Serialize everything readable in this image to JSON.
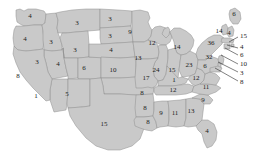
{
  "map": {
    "title": "United States electoral vote map",
    "colors": {
      "land_fill": "#c9c9c9",
      "land_fill_light": "#efefef",
      "border": "#8e8e8e",
      "outline": "#6f6f6f",
      "background": "#ffffff",
      "label_text": "#1b1b1b",
      "leader_line": "#2b2b2b"
    },
    "states": [
      {
        "name": "washington",
        "abbr": "WA",
        "value": "4",
        "x": 30,
        "y": 16
      },
      {
        "name": "oregon",
        "abbr": "OR",
        "value": "4",
        "x": 25,
        "y": 39
      },
      {
        "name": "idaho",
        "abbr": "ID",
        "value": "3",
        "x": 51,
        "y": 42
      },
      {
        "name": "montana",
        "abbr": "MT",
        "value": "3",
        "x": 77,
        "y": 23
      },
      {
        "name": "nevada",
        "abbr": "NV",
        "value": "3",
        "x": 37,
        "y": 62
      },
      {
        "name": "wyoming",
        "abbr": "WY",
        "value": "3",
        "x": 75,
        "y": 50
      },
      {
        "name": "north-dakota",
        "abbr": "ND",
        "value": "3",
        "x": 110,
        "y": 19
      },
      {
        "name": "south-dakota",
        "abbr": "SD",
        "value": "3",
        "x": 110,
        "y": 36
      },
      {
        "name": "nebraska",
        "abbr": "NE",
        "value": "4",
        "x": 111,
        "y": 50
      },
      {
        "name": "utah",
        "abbr": "UT",
        "value": "4",
        "x": 58,
        "y": 64
      },
      {
        "name": "colorado",
        "abbr": "CO",
        "value": "6",
        "x": 84,
        "y": 68
      },
      {
        "name": "kansas",
        "abbr": "KS",
        "value": "10",
        "x": 113,
        "y": 70
      },
      {
        "name": "california",
        "abbr": "CA",
        "value": "8",
        "x": 18,
        "y": 76
      },
      {
        "name": "arizona",
        "abbr": "AZ",
        "value": "1",
        "x": 36,
        "y": 96
      },
      {
        "name": "new-mexico",
        "abbr": "NM",
        "value": "5",
        "x": 67,
        "y": 94
      },
      {
        "name": "texas",
        "abbr": "TX",
        "value": "15",
        "x": 104,
        "y": 124
      },
      {
        "name": "oklahoma",
        "abbr": "OK",
        "value": "8",
        "x": 142,
        "y": 93
      },
      {
        "name": "minnesota",
        "abbr": "MN",
        "value": "9",
        "x": 130,
        "y": 32
      },
      {
        "name": "iowa",
        "abbr": "IA",
        "value": "13",
        "x": 138,
        "y": 58
      },
      {
        "name": "wisconsin",
        "abbr": "WI",
        "value": "12",
        "x": 152,
        "y": 43
      },
      {
        "name": "michigan",
        "abbr": "MI",
        "value": "14",
        "x": 177,
        "y": 47
      },
      {
        "name": "illinois",
        "abbr": "IL",
        "value": "24",
        "x": 156,
        "y": 70
      },
      {
        "name": "indiana",
        "abbr": "IN",
        "value": "15",
        "x": 172,
        "y": 70
      },
      {
        "name": "ohio",
        "abbr": "OH",
        "value": "23",
        "x": 189,
        "y": 65
      },
      {
        "name": "missouri",
        "abbr": "MO",
        "value": "17",
        "x": 146,
        "y": 78
      },
      {
        "name": "arkansas",
        "abbr": "AR",
        "value": "8",
        "x": 145,
        "y": 108
      },
      {
        "name": "louisiana",
        "abbr": "LA",
        "value": "8",
        "x": 148,
        "y": 122
      },
      {
        "name": "kentucky",
        "abbr": "KY",
        "value": "1",
        "x": 174,
        "y": 80
      },
      {
        "name": "tennessee",
        "abbr": "TN",
        "value": "12",
        "x": 173,
        "y": 90
      },
      {
        "name": "west-virginia",
        "abbr": "WV",
        "value": "12",
        "x": 196,
        "y": 78
      },
      {
        "name": "mississippi",
        "abbr": "MS",
        "value": "9",
        "x": 161,
        "y": 113
      },
      {
        "name": "alabama",
        "abbr": "AL",
        "value": "11",
        "x": 175,
        "y": 113
      },
      {
        "name": "georgia",
        "abbr": "GA",
        "value": "13",
        "x": 191,
        "y": 111
      },
      {
        "name": "south-carolina",
        "abbr": "SC",
        "value": "9",
        "x": 203,
        "y": 100
      },
      {
        "name": "north-carolina",
        "abbr": "NC",
        "value": "11",
        "x": 206,
        "y": 87
      },
      {
        "name": "florida",
        "abbr": "FL",
        "value": "4",
        "x": 207,
        "y": 131
      },
      {
        "name": "virginia",
        "abbr": "VA",
        "value": "6",
        "x": 205,
        "y": 66
      },
      {
        "name": "new-york",
        "abbr": "NY",
        "value": "36",
        "x": 211,
        "y": 43
      },
      {
        "name": "pennsylvania",
        "abbr": "PA",
        "value": "32",
        "x": 209,
        "y": 57
      },
      {
        "name": "maine",
        "abbr": "ME",
        "value": "6",
        "x": 234,
        "y": 14
      },
      {
        "name": "vermont-cluster",
        "abbr": "VT",
        "value": "14",
        "x": 219,
        "y": 31
      },
      {
        "name": "new-hampshire",
        "abbr": "NH",
        "value": "4",
        "x": 229,
        "y": 33
      }
    ],
    "callouts": [
      {
        "name": "massachusetts",
        "abbr": "MA",
        "value": "15",
        "label_x": 240,
        "label_y": 36,
        "line_x1": 238,
        "line_y1": 37,
        "line_x2": 229,
        "line_y2": 42
      },
      {
        "name": "rhode-island",
        "abbr": "RI",
        "value": "4",
        "label_x": 240,
        "label_y": 47,
        "line_x1": 238,
        "line_y1": 48,
        "line_x2": 227,
        "line_y2": 45
      },
      {
        "name": "connecticut",
        "abbr": "CT",
        "value": "6",
        "label_x": 240,
        "label_y": 55,
        "line_x1": 238,
        "line_y1": 55,
        "line_x2": 225,
        "line_y2": 48
      },
      {
        "name": "new-jersey",
        "abbr": "NJ",
        "value": "10",
        "label_x": 240,
        "label_y": 64,
        "line_x1": 238,
        "line_y1": 64,
        "line_x2": 221,
        "line_y2": 55
      },
      {
        "name": "delaware",
        "abbr": "DE",
        "value": "3",
        "label_x": 240,
        "label_y": 73,
        "line_x1": 238,
        "line_y1": 72,
        "line_x2": 218,
        "line_y2": 62
      },
      {
        "name": "maryland",
        "abbr": "MD",
        "value": "8",
        "label_x": 240,
        "label_y": 82,
        "line_x1": 238,
        "line_y1": 81,
        "line_x2": 215,
        "line_y2": 68
      }
    ]
  }
}
